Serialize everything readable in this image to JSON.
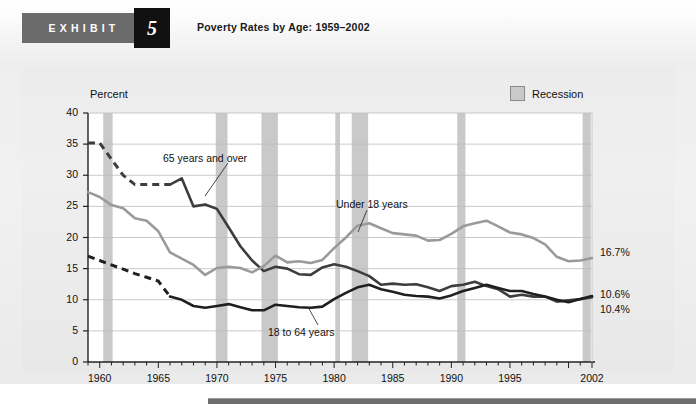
{
  "header": {
    "exhibit_word": "EXHIBIT",
    "exhibit_number": "5",
    "title": "Poverty Rates by Age: 1959–2002"
  },
  "legend": {
    "recession_label": "Recession",
    "recession_color": "#c9c9c9"
  },
  "axis": {
    "y_title": "Percent",
    "y_ticks": [
      "0",
      "5",
      "10",
      "15",
      "20",
      "25",
      "30",
      "35",
      "40"
    ],
    "x_ticks": [
      "1960",
      "1965",
      "1970",
      "1975",
      "1980",
      "1985",
      "1990",
      "1995",
      "2002"
    ]
  },
  "end_labels": [
    {
      "name": "under-18-end-value",
      "text": "16.7%"
    },
    {
      "name": "over-65-end-value",
      "text": "10.6%"
    },
    {
      "name": "18-to-64-end-value",
      "text": "10.4%"
    }
  ],
  "series_labels": [
    {
      "name": "over-65-series-label",
      "text": "65 years and over"
    },
    {
      "name": "under-18-series-label",
      "text": "Under 18 years"
    },
    {
      "name": "18-to-64-series-label",
      "text": "18 to 64 years"
    }
  ],
  "chart_data": {
    "type": "line",
    "title": "Poverty Rates by Age: 1959–2002",
    "xlabel": "",
    "ylabel": "Percent",
    "xlim": [
      1959,
      2002
    ],
    "ylim": [
      0,
      40
    ],
    "grid": "horizontal",
    "legend_position": "top-right",
    "x": [
      1959,
      1960,
      1961,
      1962,
      1963,
      1964,
      1965,
      1966,
      1967,
      1968,
      1969,
      1970,
      1971,
      1972,
      1973,
      1974,
      1975,
      1976,
      1977,
      1978,
      1979,
      1980,
      1981,
      1982,
      1983,
      1984,
      1985,
      1986,
      1987,
      1988,
      1989,
      1990,
      1991,
      1992,
      1993,
      1994,
      1995,
      1996,
      1997,
      1998,
      1999,
      2000,
      2001,
      2002
    ],
    "series": [
      {
        "name": "65 years and over",
        "color": "#3d3d3d",
        "dashed_until": 1966,
        "end_value": 10.6,
        "values": [
          35.2,
          35.2,
          32.6,
          30.0,
          28.5,
          28.5,
          28.5,
          28.5,
          29.5,
          25.0,
          25.3,
          24.6,
          21.6,
          18.6,
          16.3,
          14.6,
          15.3,
          15.0,
          14.1,
          14.0,
          15.2,
          15.7,
          15.3,
          14.6,
          13.8,
          12.4,
          12.6,
          12.4,
          12.5,
          12.0,
          11.4,
          12.2,
          12.4,
          12.9,
          12.2,
          11.7,
          10.5,
          10.8,
          10.5,
          10.5,
          9.7,
          9.9,
          10.1,
          10.4
        ]
      },
      {
        "name": "Under 18 years",
        "color": "#9a9a9a",
        "dashed_until": null,
        "end_value": 16.7,
        "values": [
          27.3,
          26.5,
          25.2,
          24.7,
          23.1,
          22.7,
          21.0,
          17.6,
          16.6,
          15.6,
          14.0,
          15.1,
          15.3,
          15.1,
          14.4,
          15.4,
          17.1,
          16.0,
          16.2,
          15.9,
          16.4,
          18.3,
          20.0,
          21.9,
          22.3,
          21.5,
          20.7,
          20.5,
          20.3,
          19.5,
          19.6,
          20.6,
          21.8,
          22.3,
          22.7,
          21.8,
          20.8,
          20.5,
          19.9,
          18.9,
          16.9,
          16.2,
          16.3,
          16.7
        ]
      },
      {
        "name": "18 to 64 years",
        "color": "#1f1f1f",
        "dashed_until": 1966,
        "end_value": 10.4,
        "values": [
          17.0,
          16.3,
          15.6,
          14.9,
          14.2,
          13.6,
          13.0,
          10.5,
          10.0,
          9.0,
          8.7,
          9.0,
          9.3,
          8.8,
          8.3,
          8.3,
          9.2,
          9.0,
          8.8,
          8.7,
          8.9,
          10.1,
          11.1,
          12.0,
          12.4,
          11.7,
          11.3,
          10.8,
          10.6,
          10.5,
          10.2,
          10.7,
          11.4,
          11.9,
          12.4,
          11.9,
          11.4,
          11.4,
          10.9,
          10.5,
          10.0,
          9.6,
          10.1,
          10.6
        ]
      }
    ],
    "recessions": [
      {
        "start": 1960.3,
        "end": 1961.1
      },
      {
        "start": 1969.9,
        "end": 1970.9
      },
      {
        "start": 1973.8,
        "end": 1975.2
      },
      {
        "start": 1980.1,
        "end": 1980.5
      },
      {
        "start": 1981.5,
        "end": 1982.9
      },
      {
        "start": 1990.5,
        "end": 1991.2
      },
      {
        "start": 2001.2,
        "end": 2001.9
      }
    ]
  }
}
